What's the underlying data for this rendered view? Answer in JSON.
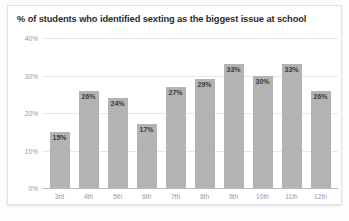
{
  "chart_data": {
    "type": "bar",
    "title": "% of students who identified sexting as the biggest issue at school",
    "xlabel": "",
    "ylabel": "",
    "categories": [
      "3rd",
      "4th",
      "5th",
      "6th",
      "7th",
      "8th",
      "9th",
      "10th",
      "11th",
      "12th"
    ],
    "values": [
      15,
      26,
      24,
      17,
      27,
      29,
      33,
      30,
      33,
      26
    ],
    "value_labels": [
      "15%",
      "26%",
      "24%",
      "17%",
      "27%",
      "29%",
      "33%",
      "30%",
      "33%",
      "26%"
    ],
    "ylim": [
      0,
      40
    ],
    "y_ticks": [
      0,
      10,
      20,
      30,
      40
    ],
    "y_tick_labels": [
      "0%",
      "10%",
      "20%",
      "30%",
      "40%"
    ],
    "grid": true,
    "legend": false,
    "bar_color": "#b3b3b3",
    "gridline_color": "#e8e8e8",
    "axis_color": "#b9b9b9",
    "tick_label_color": "#9a9a9a",
    "title_color": "#2b2b2b",
    "value_label_color": "#3a3a3a",
    "card_background": "#ffffff",
    "card_border_color": "#e2e2e2",
    "page_background": "#fdfdfd"
  }
}
